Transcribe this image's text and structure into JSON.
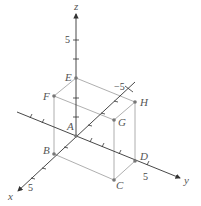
{
  "figure": {
    "type": "3d-coordinate-box",
    "axes": {
      "x": {
        "label": "x",
        "tick_label": "5"
      },
      "y": {
        "label": "y",
        "tick_label": "5"
      },
      "z": {
        "label": "z",
        "tick_label": "5"
      },
      "neg_x": {
        "tick_label": "−5"
      }
    },
    "points": [
      {
        "name": "A",
        "label": "A"
      },
      {
        "name": "B",
        "label": "B"
      },
      {
        "name": "C",
        "label": "C"
      },
      {
        "name": "D",
        "label": "D"
      },
      {
        "name": "E",
        "label": "E"
      },
      {
        "name": "F",
        "label": "F"
      },
      {
        "name": "G",
        "label": "G"
      },
      {
        "name": "H",
        "label": "H"
      }
    ],
    "colors": {
      "axis": "#333333",
      "box": "#9a9a9a",
      "point": "#777777",
      "label": "#555555"
    }
  }
}
